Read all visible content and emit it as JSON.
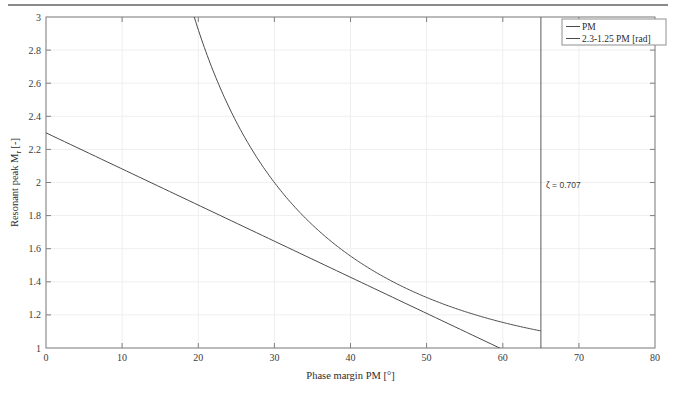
{
  "figure": {
    "background_color": "#ffffff",
    "top_rule_color": "#8a8a8a"
  },
  "chart_data": {
    "type": "line",
    "title": "",
    "xlabel": "Phase margin PM [°]",
    "ylabel": "Resonant peak M_r [-]",
    "ylabel_main": "Resonant peak M",
    "ylabel_sub": "r",
    "ylabel_unit": " [-]",
    "xlim": [
      0,
      80
    ],
    "ylim": [
      1,
      3
    ],
    "xticks": [
      0,
      10,
      20,
      30,
      40,
      50,
      60,
      70,
      80
    ],
    "yticks": [
      1,
      1.2,
      1.4,
      1.6,
      1.8,
      2,
      2.2,
      2.4,
      2.6,
      2.8,
      3
    ],
    "xtick_labels": [
      "0",
      "10",
      "20",
      "30",
      "40",
      "50",
      "60",
      "70",
      "80"
    ],
    "ytick_labels": [
      "1",
      "1.2",
      "1.4",
      "1.6",
      "1.8",
      "2",
      "2.2",
      "2.4",
      "2.6",
      "2.8",
      "3"
    ],
    "grid": true,
    "grid_color": "#efefef",
    "axis_color": "#7f7f7f",
    "line_color": "#4a4a4a",
    "legend_position": "top-right",
    "legend_border_color": "#8f8f8f",
    "series": [
      {
        "name": "PM",
        "label": "PM",
        "color": "#4a4a4a",
        "comment": "Exact resonant peak Mr = 1/sin(PM); plotted from PM where Mr<=3 up to PM=65",
        "x": [
          19.47,
          20,
          22,
          24,
          26,
          28,
          30,
          32,
          34,
          36,
          38,
          40,
          42,
          44,
          46,
          48,
          50,
          52,
          54,
          56,
          58,
          60,
          62,
          64,
          65
        ],
        "y": [
          3.0,
          2.924,
          2.669,
          2.459,
          2.281,
          2.13,
          2.0,
          1.887,
          1.788,
          1.701,
          1.624,
          1.556,
          1.494,
          1.44,
          1.39,
          1.346,
          1.305,
          1.269,
          1.236,
          1.206,
          1.18,
          1.155,
          1.133,
          1.113,
          1.103
        ]
      },
      {
        "name": "2.3-1.25 PM [rad]",
        "label": "2.3-1.25 PM [rad]",
        "color": "#4a4a4a",
        "comment": "Linear approximation Mr = 2.3 - 1.25*PM[rad]; valid from PM=0 to PM=65",
        "x": [
          0,
          10,
          20,
          30,
          40,
          50,
          59.56,
          60,
          65
        ],
        "y": [
          2.3,
          2.082,
          1.864,
          1.645,
          1.427,
          1.209,
          1.0,
          0.991,
          0.882
        ]
      }
    ],
    "annotations": [
      {
        "name": "zeta-annotation",
        "text": "ζ = 0.707",
        "x": 65.6,
        "y": 1.83,
        "comment": "Label next to the vertical reference line"
      }
    ],
    "reference_lines": [
      {
        "name": "zeta-vertical-line",
        "orientation": "vertical",
        "x": 65,
        "color": "#5a5a5a",
        "label": "ζ = 0.707"
      }
    ]
  }
}
